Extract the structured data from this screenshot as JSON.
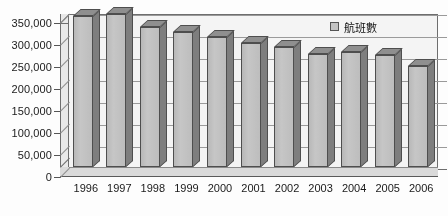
{
  "chart_data": {
    "type": "bar",
    "title": "",
    "xlabel": "",
    "ylabel": "",
    "categories": [
      "1996",
      "1997",
      "1998",
      "1999",
      "2000",
      "2001",
      "2002",
      "2003",
      "2004",
      "2005",
      "2006"
    ],
    "values": [
      343000,
      348000,
      318000,
      306000,
      295000,
      281000,
      272000,
      257000,
      261000,
      254000,
      230000
    ],
    "series": [
      {
        "name": "航班數",
        "values": [
          343000,
          348000,
          318000,
          306000,
          295000,
          281000,
          272000,
          257000,
          261000,
          254000,
          230000
        ]
      }
    ],
    "ylim": [
      0,
      350000
    ],
    "ytick_values": [
      0,
      50000,
      100000,
      150000,
      200000,
      250000,
      300000,
      350000
    ],
    "ytick_labels": [
      "0",
      "50,000",
      "100,000",
      "150,000",
      "200,000",
      "250,000",
      "300,000",
      "350,000"
    ],
    "xtick_labels": [
      "1996",
      "1997",
      "1998",
      "1999",
      "2000",
      "2001",
      "2002",
      "2003",
      "2004",
      "2005",
      "2006"
    ],
    "grid": true,
    "legend_position": "top-right",
    "legend_entries": [
      "航班數"
    ],
    "style": "3d-column",
    "bar_color": "#c0c0c0",
    "bar_edge_color": "#4e4e4e",
    "plot_background": "#f4f4f4",
    "gridline_color": "#9a9a9a"
  },
  "legend": {
    "label": "航班數",
    "swatch_color": "#c4c4c4"
  },
  "axes": {
    "y_labels": [
      "350,000",
      "300,000",
      "250,000",
      "200,000",
      "150,000",
      "100,000",
      "50,000",
      "0"
    ],
    "x_labels": [
      "1996",
      "1997",
      "1998",
      "1999",
      "2000",
      "2001",
      "2002",
      "2003",
      "2004",
      "2005",
      "2006"
    ]
  }
}
